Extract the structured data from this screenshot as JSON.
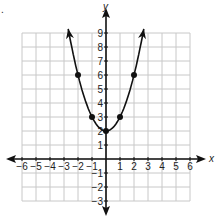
{
  "bullet": ".",
  "chart_data": {
    "type": "line",
    "title": "",
    "function": "y = x^2 + 2",
    "xlabel": "x",
    "ylabel": "y",
    "xlim": [
      -6,
      6
    ],
    "ylim": [
      -3,
      9
    ],
    "grid": true,
    "x_ticks": [
      -6,
      -5,
      -4,
      -3,
      -2,
      -1,
      1,
      2,
      3,
      4,
      5,
      6
    ],
    "y_ticks": [
      -3,
      -2,
      -1,
      1,
      2,
      3,
      4,
      5,
      6,
      7,
      8,
      9
    ],
    "x_tick_labels": [
      "−6",
      "−5",
      "−4",
      "−3",
      "−2",
      "−1",
      "1",
      "2",
      "3",
      "4",
      "5",
      "6"
    ],
    "y_tick_labels": [
      "−3",
      "−2",
      "−1",
      "1",
      "2",
      "3",
      "4",
      "5",
      "6",
      "7",
      "8",
      "9"
    ],
    "points": [
      {
        "x": -2,
        "y": 6
      },
      {
        "x": -1,
        "y": 3
      },
      {
        "x": 0,
        "y": 2
      },
      {
        "x": 1,
        "y": 3
      },
      {
        "x": 2,
        "y": 6
      }
    ],
    "curve_has_arrows": true,
    "axes_have_arrows": true
  }
}
